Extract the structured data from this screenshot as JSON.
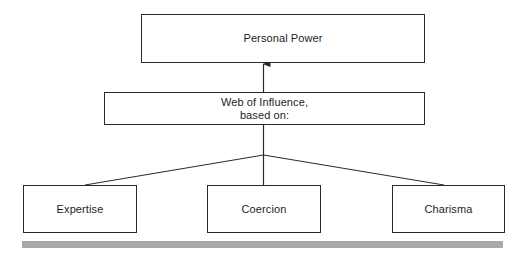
{
  "diagram": {
    "type": "hierarchy",
    "top": {
      "label": "Personal Power"
    },
    "middle": {
      "label": "Web of Influence,\nbased on:"
    },
    "bases": [
      {
        "label": "Expertise"
      },
      {
        "label": "Coercion"
      },
      {
        "label": "Charisma"
      }
    ],
    "edges": [
      {
        "from": "Web of Influence, based on:",
        "to": "Personal Power",
        "arrow": true
      },
      {
        "from": "Expertise",
        "to": "Web of Influence, based on:",
        "arrow": false
      },
      {
        "from": "Coercion",
        "to": "Web of Influence, based on:",
        "arrow": false
      },
      {
        "from": "Charisma",
        "to": "Web of Influence, based on:",
        "arrow": false
      }
    ],
    "colors": {
      "line": "#2a2a2a",
      "rule": "#a9a9a9",
      "background": "#ffffff"
    }
  }
}
